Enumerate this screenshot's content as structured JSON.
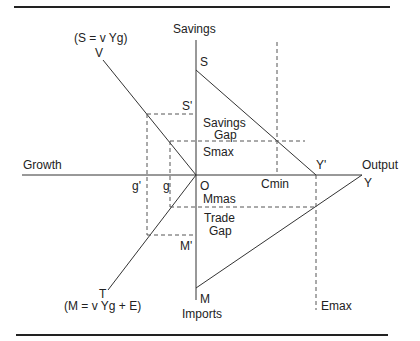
{
  "diagram": {
    "axes": {
      "vertical_top": "Savings",
      "vertical_bottom": "Imports",
      "horizontal_left": "Growth",
      "horizontal_right": "Output",
      "origin": "O"
    },
    "equations": {
      "savings": "(S = v Yg)",
      "imports": "(M = v Yg + E)"
    },
    "points": {
      "V": "V",
      "T": "T",
      "S": "S",
      "S_prime": "S'",
      "M": "M",
      "M_prime": "M'",
      "Y": "Y",
      "Y_prime": "Y'",
      "g": "g",
      "g_prime": "g'",
      "Cmin": "Cmin",
      "Emax": "Emax",
      "Smax": "Smax",
      "Mmas": "Mmas"
    },
    "regions": {
      "savings_gap_line1": "Savings",
      "savings_gap_line2": "Gap",
      "trade_gap_line1": "Trade",
      "trade_gap_line2": "Gap"
    },
    "colors": {
      "line": "#333333",
      "text": "#222222",
      "background": "#ffffff"
    }
  }
}
